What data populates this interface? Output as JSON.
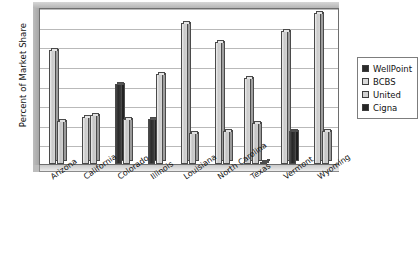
{
  "chart_data": {
    "type": "bar",
    "title": "",
    "xlabel": "",
    "ylabel": "Percent of Market Share",
    "ylim": [
      0,
      80
    ],
    "ytick_step": 10,
    "yticks": [
      0,
      10,
      20,
      30,
      40,
      50,
      60,
      70,
      80
    ],
    "ytick_labels": [
      "0",
      "10",
      "20",
      "30",
      "40",
      "50",
      "60",
      "70",
      "80"
    ],
    "grid": true,
    "legend_position": "right",
    "categories": [
      "Arizona",
      "California",
      "Colorado",
      "Illinois",
      "Louisiana",
      "North Carolina",
      "Texas",
      "Vermont",
      "Wyoming"
    ],
    "series": [
      {
        "name": "WellPoint",
        "color": "#2b2b2b",
        "values": [
          null,
          null,
          41,
          23,
          null,
          null,
          null,
          null,
          null
        ]
      },
      {
        "name": "BCBS",
        "color": "#d9d9d9",
        "values": [
          58,
          24,
          null,
          46,
          72,
          62,
          44,
          68,
          77
        ]
      },
      {
        "name": "United",
        "color": "#d2d2d2",
        "values": [
          22,
          25,
          23,
          null,
          16,
          17,
          21,
          null,
          17
        ]
      },
      {
        "name": "Cigna",
        "color": "#262626",
        "values": [
          null,
          null,
          null,
          null,
          null,
          null,
          1,
          17,
          null
        ]
      }
    ]
  },
  "legend": {
    "items": [
      {
        "label": "WellPoint",
        "swatch_class": "sw-wellpoint"
      },
      {
        "label": "BCBS",
        "swatch_class": "sw-bcbs"
      },
      {
        "label": "United",
        "swatch_class": "sw-united"
      },
      {
        "label": "Cigna",
        "swatch_class": "sw-cigna"
      }
    ]
  },
  "caption": ""
}
